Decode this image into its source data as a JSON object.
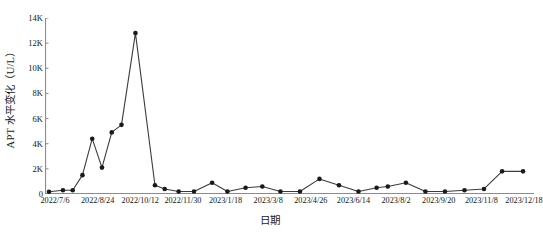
{
  "chart_data": {
    "type": "line",
    "title": "",
    "xlabel": "日期",
    "ylabel": "APT 水平变化（U/L）",
    "ylim": [
      0,
      14000
    ],
    "y_ticks": [
      0,
      2000,
      4000,
      6000,
      8000,
      10000,
      12000,
      14000
    ],
    "y_tick_labels": [
      "0",
      "2K",
      "4K",
      "6K",
      "8K",
      "10K",
      "12K",
      "14K"
    ],
    "x_tick_labels": [
      "2022/7/6",
      "2022/8/24",
      "2022/10/12",
      "2022/11/30",
      "2023/1/18",
      "2023/3/8",
      "2023/4/26",
      "2023/6/14",
      "2023/8/2",
      "2023/9/20",
      "2023/11/8",
      "2023/12/18"
    ],
    "x_tick_positions_px": [
      60,
      121,
      182,
      243,
      304,
      365,
      426,
      487,
      548,
      609,
      670,
      731
    ],
    "xlim_px": [
      45,
      534
    ],
    "grid": false,
    "legend": null,
    "marker": "circle-filled",
    "line_color": "#3c3c3c",
    "marker_color": "#1a1a1a",
    "axis_color": "#888888",
    "series": [
      {
        "name": "APT",
        "points": [
          {
            "x": 0,
            "y": 180
          },
          {
            "x": 10,
            "y": 300
          },
          {
            "x": 17,
            "y": 300
          },
          {
            "x": 24,
            "y": 1500
          },
          {
            "x": 31,
            "y": 4400
          },
          {
            "x": 38,
            "y": 2100
          },
          {
            "x": 45,
            "y": 4900
          },
          {
            "x": 52,
            "y": 5500
          },
          {
            "x": 62,
            "y": 12800
          },
          {
            "x": 76,
            "y": 700
          },
          {
            "x": 83,
            "y": 400
          },
          {
            "x": 93,
            "y": 200
          },
          {
            "x": 104,
            "y": 200
          },
          {
            "x": 117,
            "y": 900
          },
          {
            "x": 128,
            "y": 200
          },
          {
            "x": 141,
            "y": 500
          },
          {
            "x": 153,
            "y": 600
          },
          {
            "x": 166,
            "y": 200
          },
          {
            "x": 180,
            "y": 200
          },
          {
            "x": 194,
            "y": 1200
          },
          {
            "x": 208,
            "y": 700
          },
          {
            "x": 222,
            "y": 200
          },
          {
            "x": 235,
            "y": 500
          },
          {
            "x": 243,
            "y": 600
          },
          {
            "x": 256,
            "y": 900
          },
          {
            "x": 270,
            "y": 200
          },
          {
            "x": 284,
            "y": 200
          },
          {
            "x": 298,
            "y": 300
          },
          {
            "x": 312,
            "y": 400
          },
          {
            "x": 325,
            "y": 1800
          },
          {
            "x": 340,
            "y": 1800
          }
        ]
      }
    ]
  }
}
